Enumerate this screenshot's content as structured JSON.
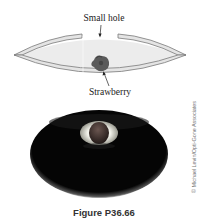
{
  "figure": {
    "caption": "Figure P36.66",
    "credit": "© Michael Levin/Opti-Gone Associates",
    "diagram": {
      "labels": {
        "hole": "Small hole",
        "object": "Strawberry"
      },
      "colors": {
        "shell_fill": "#e9e9e9",
        "shell_stroke": "#7a7a7a",
        "inner_fill": "#ececec",
        "strawberry": "#555555"
      }
    },
    "photo": {
      "description": "Dark mirror enclosure with a real image of the strawberry appearing at the hole",
      "colors": {
        "body": "#050505",
        "rim": "#9a9a9a",
        "spot_ring": "#e8e8e0",
        "spot_center": "#3a2f2c"
      }
    }
  }
}
